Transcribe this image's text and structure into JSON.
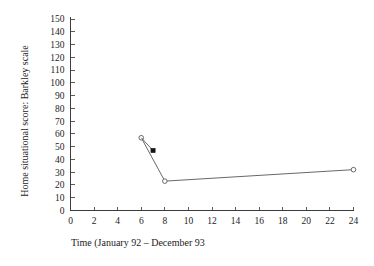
{
  "chart_data": {
    "type": "line",
    "title": "",
    "subtitle": "",
    "xlabel": "Time (January  92 – December 93",
    "ylabel": "Home situational score: Barkley scale",
    "xlim": [
      0,
      24
    ],
    "ylim": [
      0,
      150
    ],
    "xticks": [
      0,
      2,
      4,
      6,
      8,
      10,
      12,
      14,
      16,
      18,
      20,
      22,
      24
    ],
    "yticks": [
      0,
      10,
      20,
      30,
      40,
      50,
      60,
      70,
      80,
      90,
      100,
      110,
      120,
      130,
      140,
      150
    ],
    "xtick_labels": [
      "0",
      "2",
      "4",
      "6",
      "8",
      "10",
      "12",
      "14",
      "16",
      "18",
      "20",
      "22",
      "24"
    ],
    "ytick_labels": [
      "0",
      "10",
      "20",
      "30",
      "40",
      "50",
      "60",
      "70",
      "80",
      "90",
      "100",
      "110",
      "120",
      "130",
      "140",
      "150"
    ],
    "grid": false,
    "legend": false,
    "legend_position": "none",
    "colors": {
      "line": "#575757",
      "axis": "#3d3d3d",
      "marker_open_fill": "#ffffff",
      "marker_filled": "#141414",
      "background": "#ffffff"
    },
    "series": [
      {
        "name": "Home situational score",
        "marker": "open-circle",
        "points": [
          {
            "x": 6,
            "y": 57
          },
          {
            "x": 8,
            "y": 23
          },
          {
            "x": 24,
            "y": 32
          }
        ]
      },
      {
        "name": "Branch segment",
        "marker": "filled-square",
        "points": [
          {
            "x": 6,
            "y": 57
          },
          {
            "x": 7,
            "y": 47
          }
        ]
      }
    ],
    "annotations": []
  }
}
